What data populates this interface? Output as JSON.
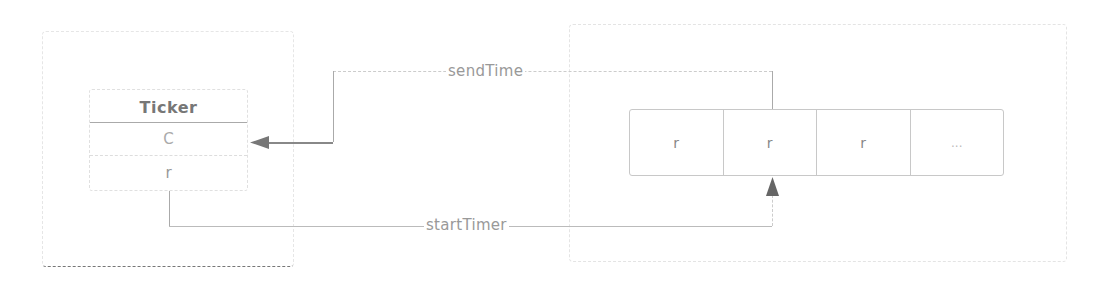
{
  "diagram": {
    "left_group": {
      "ticker": {
        "title": "Ticker",
        "fields": [
          "C",
          "r"
        ]
      }
    },
    "right_group": {
      "queue_cells": [
        "r",
        "r",
        "r",
        "..."
      ]
    },
    "edges": {
      "send_time": {
        "label": "sendTime",
        "from": "queue cell 2",
        "to": "Ticker.C"
      },
      "start_timer": {
        "label": "startTimer",
        "from": "Ticker.r",
        "to": "queue cell 2"
      }
    }
  }
}
